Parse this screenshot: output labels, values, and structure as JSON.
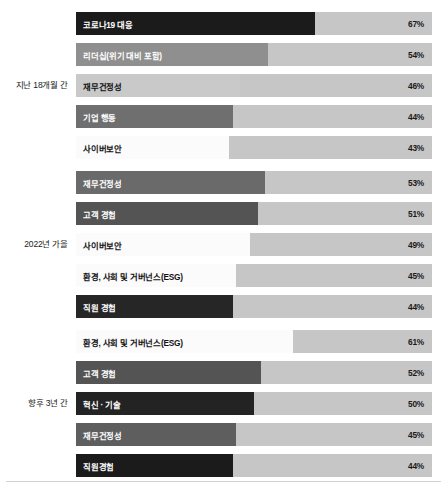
{
  "chart_data": {
    "type": "bar",
    "title": "",
    "xlabel": "",
    "ylabel": "",
    "xlim": [
      0,
      100
    ],
    "grid": false,
    "legend": "none",
    "orientation": "horizontal",
    "value_suffix": "%",
    "track_color": "#c6c6c6",
    "groups": [
      {
        "label": "지난 18개월 간",
        "categories": [
          "코로나19 대응",
          "리더십(위기 대비 포함)",
          "재무건정성",
          "기업 행동",
          "사이버보안"
        ],
        "values": [
          67,
          54,
          46,
          44,
          43
        ],
        "value_labels": [
          "67%",
          "54%",
          "46%",
          "44%",
          "43%"
        ],
        "fill_colors": [
          "#1b1b1b",
          "#8f8f8f",
          "#c9c9c9",
          "#6f6f6f",
          "#fbfbfb"
        ],
        "label_colors": [
          "light",
          "light",
          "dark",
          "light",
          "dark"
        ]
      },
      {
        "label": "2022년 가을",
        "categories": [
          "재무건정성",
          "고객 경험",
          "사이버보안",
          "환경, 사회 및 거버넌스(ESG)",
          "직원 경험"
        ],
        "values": [
          53,
          51,
          49,
          45,
          44
        ],
        "value_labels": [
          "53%",
          "51%",
          "49%",
          "45%",
          "44%"
        ],
        "fill_colors": [
          "#6a6a6a",
          "#545454",
          "#fbfbfb",
          "#fbfbfb",
          "#262626"
        ],
        "label_colors": [
          "light",
          "light",
          "dark",
          "dark",
          "light"
        ]
      },
      {
        "label": "향후 3년 간",
        "categories": [
          "환경, 사회 및 거버넌스(ESG)",
          "고객 경험",
          "혁신 · 기술",
          "재무건정성",
          "직원경험"
        ],
        "values": [
          61,
          52,
          50,
          45,
          44
        ],
        "value_labels": [
          "61%",
          "52%",
          "50%",
          "45%",
          "44%"
        ],
        "fill_colors": [
          "#fbfbfb",
          "#545454",
          "#232323",
          "#5e5e5e",
          "#1b1b1b"
        ],
        "label_colors": [
          "dark",
          "light",
          "light",
          "light",
          "light"
        ]
      }
    ]
  }
}
